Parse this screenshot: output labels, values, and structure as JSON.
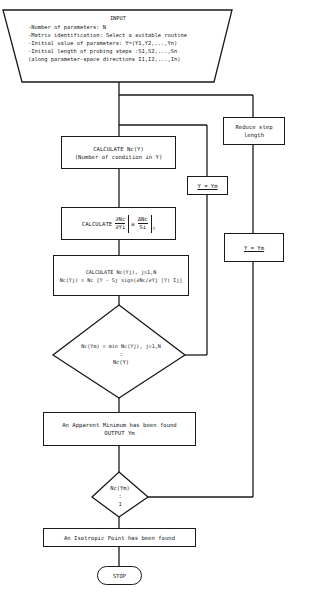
{
  "input": {
    "title": "INPUT",
    "lines": [
      "-Number of parameters: N",
      "-Matrix identification: Select a suitable routine",
      "-Initial value of parameters: Y=(Y1,Y2,...,Yn)",
      "-Initial length of probing steps :S1,S2,...,Sn",
      "(along parameter-space directions I1,I2,...,In)"
    ]
  },
  "boxes": {
    "reduce_step": [
      "Reduce step",
      "length"
    ],
    "calc_nc": [
      "CALCULATE Nc(Y)",
      "(Number of condition in Y)"
    ],
    "calc_derivative": "CALCULATE ∂Nc/∂Yi |Y = ΔNc/Si |Y",
    "calc_derivative_parts": {
      "label": "CALCULATE",
      "lhs_num": "∂Nc",
      "lhs_den": "∂Yi",
      "eq": "≅",
      "rhs_num": "ΔNc",
      "rhs_den": "Si",
      "sub": "Y"
    },
    "calc_ncyj": [
      "CALCULATE Nc(Yj), j=1,N",
      "Nc(Yj) = Nc [Y - Sj sign(∂Nc/∂Yj |Y) Ij]"
    ],
    "y_eq_ym_left": "Y = Ym",
    "y_eq_ym_right": "Y = Ym",
    "apparent_min": [
      "An Apparent Minimum has been found",
      "OUTPUT Ym"
    ],
    "isotropic": "An Isotropic Point has been found",
    "stop": "STOP"
  },
  "decisions": {
    "min_check": [
      "Nc(Ym) = min  Nc(Yj), j=1,N",
      ":",
      "Nc(Y)"
    ],
    "isotropic_check": [
      "Nc(Ym)",
      ":",
      "1"
    ]
  }
}
